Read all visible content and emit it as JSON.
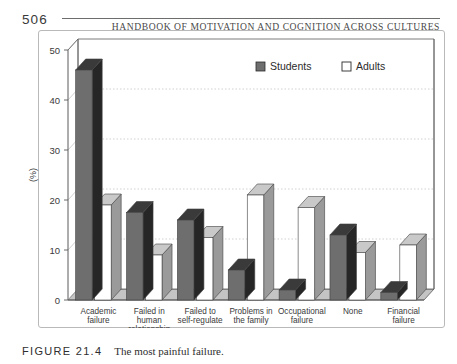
{
  "page": {
    "folio": "506",
    "running_head": "HANDBOOK OF MOTIVATION AND COGNITION ACROSS CULTURES"
  },
  "caption": {
    "number": "FIGURE 21.4",
    "text": "The most painful failure."
  },
  "colors": {
    "students_front": "#6e6e6e",
    "students_side": "#262626",
    "students_top": "#3a3a3a",
    "adults_front": "#ffffff",
    "adults_side": "#9a9a9a",
    "adults_top": "#c9c9c9",
    "floor": "#c4c4c4",
    "axis": "#5a5a5a",
    "grid": "#bdbdbd"
  },
  "chart_data": {
    "type": "bar",
    "title": "",
    "subtitle": "",
    "xlabel": "",
    "ylabel": "(%)",
    "ylim": [
      0,
      50
    ],
    "yticks": [
      0,
      10,
      20,
      30,
      40,
      50
    ],
    "ytick_labels": [
      "0",
      "10",
      "20",
      "30",
      "40",
      "50"
    ],
    "grid": true,
    "legend_position": "top-right",
    "three_d": true,
    "categories": [
      "Academic failure",
      "Failed in human relationship",
      "Failed to self-regulate",
      "Problems in the family",
      "Occupational failure",
      "None",
      "Financial failure"
    ],
    "category_lines": [
      [
        "Academic",
        "failure"
      ],
      [
        "Failed in",
        "human",
        "relationship"
      ],
      [
        "Failed to",
        "self-regulate"
      ],
      [
        "Problems in",
        "the family"
      ],
      [
        "Occupational",
        "failure"
      ],
      [
        "None"
      ],
      [
        "Financial",
        "failure"
      ]
    ],
    "series": [
      {
        "name": "Students",
        "values": [
          46,
          17.5,
          16,
          6,
          2,
          13,
          1.5
        ]
      },
      {
        "name": "Adults",
        "values": [
          19,
          9,
          12.5,
          21,
          18.5,
          9.5,
          11
        ]
      }
    ]
  }
}
